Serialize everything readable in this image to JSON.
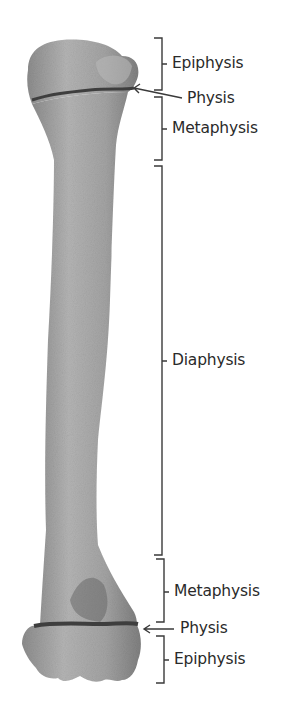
{
  "diagram": {
    "labels": [
      {
        "id": "epiphysis-top",
        "text": "Epiphysis"
      },
      {
        "id": "physis-top",
        "text": "Physis"
      },
      {
        "id": "metaphysis-top",
        "text": "Metaphysis"
      },
      {
        "id": "diaphysis",
        "text": "Diaphysis"
      },
      {
        "id": "metaphysis-bottom",
        "text": "Metaphysis"
      },
      {
        "id": "physis-bottom",
        "text": "Physis"
      },
      {
        "id": "epiphysis-bottom",
        "text": "Epiphysis"
      }
    ],
    "colors": {
      "bone": "#a9a9a9",
      "bone_dark": "#7a7a7a",
      "physis_line": "#3e3e3e",
      "bracket": "#3a3a3a",
      "text": "#2a2a2a"
    }
  }
}
